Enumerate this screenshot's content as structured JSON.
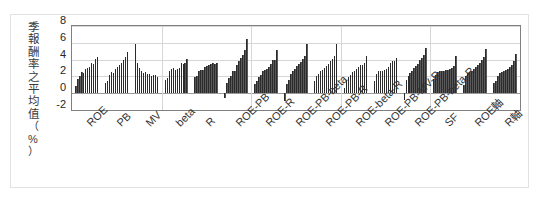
{
  "chart_data": {
    "type": "bar",
    "title": "",
    "subtitle": "",
    "xlabel": "",
    "ylabel": "季報酬率之平均值（%）",
    "ylim": [
      -2,
      8
    ],
    "yticks": [
      8,
      6,
      4,
      2,
      0,
      -2
    ],
    "grid": true,
    "legend": null,
    "legend_position": "none",
    "bar_color": "#595959",
    "categories": [
      "ROE",
      "PB",
      "MV",
      "beta",
      "R",
      "ROE-PB",
      "ROE-R",
      "ROE-PB-beta",
      "ROE-PB-R",
      "ROE-beta-R",
      "ROE-PB-MV-R",
      "ROE-PB-beta-R",
      "SF",
      "ROE軸",
      "R軸"
    ],
    "groups": [
      {
        "name": "ROE",
        "values": [
          0.8,
          1.7,
          2.1,
          2.5,
          2.4,
          2.9,
          3.0,
          3.1,
          3.6,
          3.5,
          4.1,
          4.3
        ]
      },
      {
        "name": "PB",
        "values": [
          1.2,
          1.4,
          2.2,
          2.5,
          2.4,
          2.9,
          3.1,
          3.3,
          3.6,
          4.0,
          4.3,
          4.9
        ]
      },
      {
        "name": "MV",
        "values": [
          5.9,
          3.6,
          3.0,
          2.7,
          2.4,
          2.5,
          2.3,
          2.3,
          2.1,
          2.2,
          2.2,
          1.9
        ]
      },
      {
        "name": "beta",
        "values": [
          1.6,
          1.8,
          2.6,
          2.9,
          3.0,
          2.8,
          2.9,
          3.0,
          3.6,
          3.5,
          3.6,
          4.1
        ]
      },
      {
        "name": "R",
        "values": [
          1.9,
          2.0,
          2.6,
          2.8,
          2.8,
          3.1,
          3.2,
          3.3,
          3.5,
          3.6,
          3.5,
          3.6
        ]
      },
      {
        "name": "ROE-PB",
        "values": [
          -0.6,
          1.2,
          1.8,
          2.1,
          2.6,
          2.7,
          3.3,
          3.8,
          4.2,
          4.6,
          5.1,
          6.5
        ]
      },
      {
        "name": "ROE-R",
        "values": [
          1.1,
          1.4,
          1.9,
          2.2,
          2.6,
          2.8,
          2.9,
          3.1,
          3.5,
          3.9,
          4.0,
          5.1
        ]
      },
      {
        "name": "ROE-PB-beta",
        "values": [
          -0.9,
          1.1,
          1.6,
          2.3,
          2.6,
          2.9,
          3.2,
          3.5,
          3.7,
          4.1,
          4.4,
          5.9
        ]
      },
      {
        "name": "ROE-PB-R",
        "values": [
          1.5,
          2.1,
          2.3,
          2.6,
          2.8,
          3.0,
          3.2,
          3.5,
          3.8,
          4.1,
          4.4,
          5.9
        ]
      },
      {
        "name": "ROE-beta-R",
        "values": [
          0.6,
          1.6,
          1.9,
          2.2,
          2.5,
          2.6,
          2.9,
          3.1,
          3.3,
          3.4,
          3.6,
          4.4
        ]
      },
      {
        "name": "ROE-PB-MV-R",
        "values": [
          1.4,
          2.3,
          2.6,
          2.7,
          2.7,
          2.8,
          2.9,
          3.1,
          3.6,
          3.8,
          3.8,
          4.2
        ]
      },
      {
        "name": "ROE-PB-beta-R",
        "values": [
          -0.8,
          1.6,
          2.1,
          2.4,
          2.7,
          3.0,
          3.2,
          3.5,
          3.9,
          4.2,
          4.5,
          5.4
        ]
      },
      {
        "name": "SF",
        "values": [
          1.7,
          2.2,
          2.5,
          2.6,
          2.7,
          2.7,
          2.8,
          2.8,
          2.9,
          3.0,
          3.2,
          4.4
        ]
      },
      {
        "name": "ROE軸",
        "values": [
          1.0,
          2.1,
          2.4,
          2.5,
          2.7,
          2.9,
          3.1,
          3.3,
          3.6,
          3.9,
          4.3,
          5.3
        ]
      },
      {
        "name": "R軸",
        "values": [
          1.2,
          1.5,
          2.1,
          2.4,
          2.5,
          2.6,
          2.8,
          2.9,
          3.1,
          3.3,
          3.8,
          4.7
        ]
      }
    ]
  }
}
